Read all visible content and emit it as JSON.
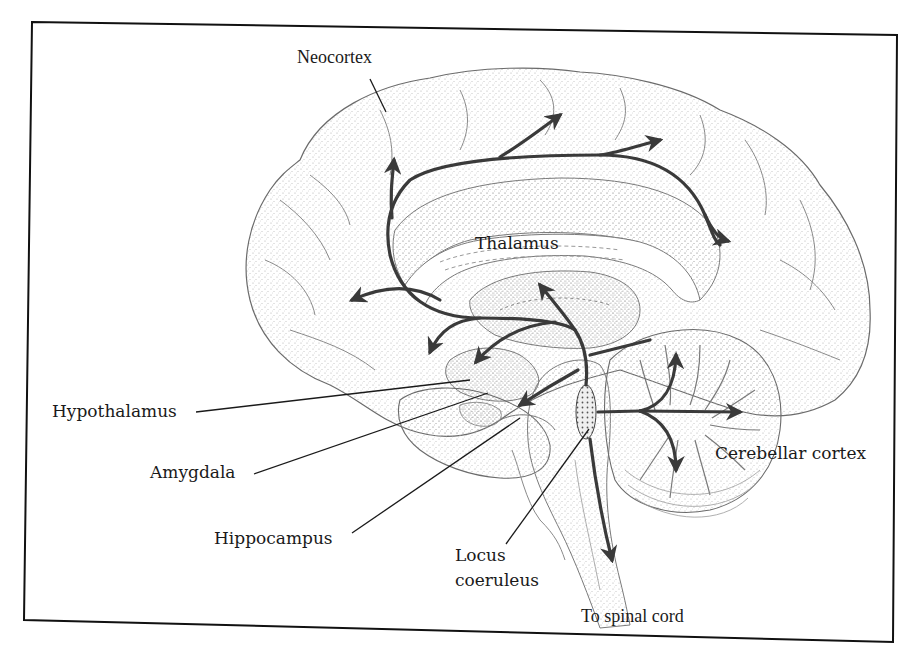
{
  "figure": {
    "type": "brain-sagittal-diagram",
    "colors": {
      "frame": "#111111",
      "outline": "#6b6b6b",
      "stipple": "#9a9a9a",
      "pathway": "#3a3a3a",
      "label_text": "#1a1a1a",
      "leader_line": "#1a1a1a",
      "background": "#ffffff"
    }
  },
  "labels": {
    "neocortex": "Neocortex",
    "thalamus": "Thalamus",
    "hypothalamus": "Hypothalamus",
    "amygdala": "Amygdala",
    "hippocampus": "Hippocampus",
    "locus_coeruleus_line1": "Locus",
    "locus_coeruleus_line2": "coeruleus",
    "cerebellar_cortex": "Cerebellar cortex",
    "spinal_cord": "To spinal cord"
  },
  "pathways": [
    {
      "name": "to-neocortex-frontal",
      "direction": "up"
    },
    {
      "name": "to-neocortex-superior",
      "direction": "up-right"
    },
    {
      "name": "to-neocortex-parietal",
      "direction": "right"
    },
    {
      "name": "to-neocortex-occipital",
      "direction": "right"
    },
    {
      "name": "to-prefrontal",
      "direction": "left"
    },
    {
      "name": "to-orbitofrontal",
      "direction": "down-left"
    },
    {
      "name": "to-hypothalamus",
      "direction": "down-left"
    },
    {
      "name": "to-thalamus",
      "direction": "up"
    },
    {
      "name": "to-amygdala-hippocampus",
      "direction": "down-left"
    },
    {
      "name": "to-cerebellum-up",
      "direction": "up"
    },
    {
      "name": "to-cerebellum-right",
      "direction": "right"
    },
    {
      "name": "to-cerebellum-down",
      "direction": "down"
    },
    {
      "name": "to-spinal-cord",
      "direction": "down"
    }
  ]
}
